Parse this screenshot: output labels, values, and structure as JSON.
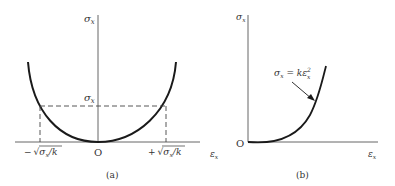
{
  "panels": [
    {
      "id": "a",
      "caption": "(a)",
      "y_axis_label": "σ",
      "y_axis_sub": "x",
      "x_axis_label": "ε",
      "x_axis_sub": "x",
      "origin_label": "O",
      "level_label": "σ",
      "level_sub": "x",
      "neg_root_prefix": "−",
      "pos_root_prefix": "+",
      "root_text": "σ",
      "root_sub": "x",
      "root_tail": "/k"
    },
    {
      "id": "b",
      "caption": "(b)",
      "y_axis_label": "σ",
      "y_axis_sub": "x",
      "x_axis_label": "ε",
      "x_axis_sub": "x",
      "origin_label": "O",
      "equation_lhs": "σ",
      "equation_lhs_sub": "x",
      "equation_mid": " = kε",
      "equation_sup": "2",
      "equation_sub": "x"
    }
  ],
  "colors": {
    "ink": "#1a1a1a",
    "axis": "#555555",
    "text": "#333333"
  }
}
